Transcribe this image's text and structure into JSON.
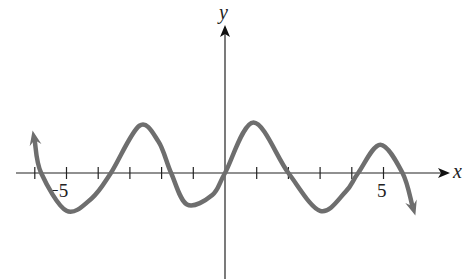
{
  "chart_data": {
    "type": "line",
    "title": "",
    "xlabel": "x",
    "ylabel": "y",
    "xlim": [
      -6.5,
      7.0
    ],
    "ylim": [
      -3.0,
      5.0
    ],
    "grid": false,
    "legend": null,
    "x_ticks": [
      -6,
      -5,
      -4,
      -3,
      -2,
      -1,
      1,
      2,
      3,
      4,
      5
    ],
    "x_tick_labels": [
      {
        "value": -5,
        "label": "−5"
      },
      {
        "value": 5,
        "label": "5"
      }
    ],
    "series": [
      {
        "name": "curve",
        "color": "#6e6e6e",
        "arrow_start": true,
        "arrow_end": true,
        "points": [
          {
            "x": -6.0,
            "y": 1.0
          },
          {
            "x": -5.8,
            "y": 0.0
          },
          {
            "x": -5.0,
            "y": -1.2
          },
          {
            "x": -4.2,
            "y": -0.8
          },
          {
            "x": -3.6,
            "y": 0.0
          },
          {
            "x": -2.7,
            "y": 1.5
          },
          {
            "x": -2.1,
            "y": 1.0
          },
          {
            "x": -1.7,
            "y": 0.0
          },
          {
            "x": -1.2,
            "y": -1.0
          },
          {
            "x": -0.4,
            "y": -0.7
          },
          {
            "x": 0.0,
            "y": 0.0
          },
          {
            "x": 0.9,
            "y": 1.6
          },
          {
            "x": 2.0,
            "y": 0.0
          },
          {
            "x": 3.0,
            "y": -1.2
          },
          {
            "x": 3.8,
            "y": -0.6
          },
          {
            "x": 4.2,
            "y": 0.0
          },
          {
            "x": 4.9,
            "y": 0.9
          },
          {
            "x": 5.6,
            "y": 0.0
          },
          {
            "x": 5.9,
            "y": -1.0
          }
        ]
      }
    ]
  }
}
